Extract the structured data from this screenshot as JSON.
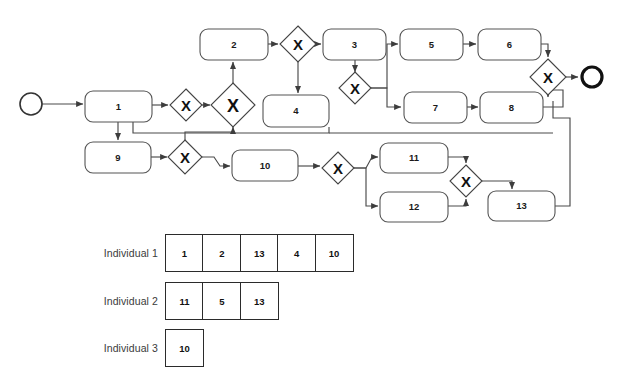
{
  "diagram": {
    "type": "bpmn-process-model",
    "start_event": {
      "name": "start-event"
    },
    "end_event": {
      "name": "end-event"
    },
    "tasks": [
      {
        "id": "t1",
        "label": "1",
        "x": 85,
        "y": 91,
        "w": 67,
        "h": 31
      },
      {
        "id": "t2",
        "label": "2",
        "x": 200,
        "y": 29,
        "w": 68,
        "h": 31
      },
      {
        "id": "t3",
        "label": "3",
        "x": 323,
        "y": 29,
        "w": 63,
        "h": 31
      },
      {
        "id": "t4",
        "label": "4",
        "x": 263,
        "y": 95,
        "w": 66,
        "h": 32
      },
      {
        "id": "t5",
        "label": "5",
        "x": 400,
        "y": 29,
        "w": 63,
        "h": 31
      },
      {
        "id": "t6",
        "label": "6",
        "x": 478,
        "y": 29,
        "w": 63,
        "h": 31
      },
      {
        "id": "t7",
        "label": "7",
        "x": 404,
        "y": 92,
        "w": 63,
        "h": 31
      },
      {
        "id": "t8",
        "label": "8",
        "x": 480,
        "y": 92,
        "w": 63,
        "h": 31
      },
      {
        "id": "t9",
        "label": "9",
        "x": 85,
        "y": 142,
        "w": 66,
        "h": 31
      },
      {
        "id": "t10",
        "label": "10",
        "x": 232,
        "y": 150,
        "w": 66,
        "h": 31
      },
      {
        "id": "t11",
        "label": "11",
        "x": 380,
        "y": 143,
        "w": 68,
        "h": 30
      },
      {
        "id": "t12",
        "label": "12",
        "x": 380,
        "y": 192,
        "w": 68,
        "h": 30
      },
      {
        "id": "t13",
        "label": "13",
        "x": 488,
        "y": 191,
        "w": 67,
        "h": 30
      }
    ],
    "gateways": [
      {
        "id": "g1",
        "label": "X",
        "cx": 186,
        "cy": 105,
        "r": 16
      },
      {
        "id": "g2",
        "label": "X",
        "cx": 233,
        "cy": 105,
        "r": 22
      },
      {
        "id": "g3",
        "label": "X",
        "cx": 298,
        "cy": 44,
        "r": 18
      },
      {
        "id": "g4",
        "label": "X",
        "cx": 355,
        "cy": 88,
        "r": 16
      },
      {
        "id": "g5",
        "label": "X",
        "cx": 548,
        "cy": 77,
        "r": 18
      },
      {
        "id": "g6",
        "label": "X",
        "cx": 185,
        "cy": 157,
        "r": 17
      },
      {
        "id": "g7",
        "label": "X",
        "cx": 338,
        "cy": 168,
        "r": 16
      },
      {
        "id": "g8",
        "label": "X",
        "cx": 466,
        "cy": 181,
        "r": 16
      }
    ]
  },
  "individuals": {
    "rows": [
      {
        "label": "Individual 1",
        "cells": [
          "1",
          "2",
          "13",
          "4",
          "10"
        ]
      },
      {
        "label": "Individual 2",
        "cells": [
          "11",
          "5",
          "13"
        ]
      },
      {
        "label": "Individual 3",
        "cells": [
          "10"
        ]
      }
    ]
  }
}
